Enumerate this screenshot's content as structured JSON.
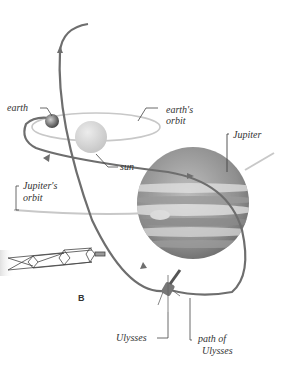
{
  "diagram": {
    "panel_letter": "B",
    "labels": {
      "earth": "earth",
      "earths_orbit_line1": "earth's",
      "earths_orbit_line2": "orbit",
      "sun": "sun",
      "jupiter": "Jupiter",
      "jupiters_orbit_line1": "Jupiter's",
      "jupiters_orbit_line2": "orbit",
      "ulysses": "Ulysses",
      "path_of_ulysses_line1": "path of",
      "path_of_ulysses_line2": "Ulysses"
    },
    "colors": {
      "path": "#6e6e6e",
      "orbit": "#c8c8c8",
      "sun": "#d9d9d9",
      "jupiter_dark": "#7a7a7a",
      "jupiter_light": "#d6d6d6",
      "leader": "#444444",
      "text": "#333333"
    }
  }
}
